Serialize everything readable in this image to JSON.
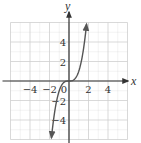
{
  "chart_data": {
    "type": "line",
    "title": "",
    "function": "y = x^3",
    "xlabel": "x",
    "ylabel": "y",
    "xlim": [
      -6,
      6
    ],
    "ylim": [
      -6,
      6
    ],
    "grid": true,
    "grid_step": 1,
    "x_ticks": [
      -4,
      -2,
      0,
      2,
      4
    ],
    "y_ticks": [
      4,
      2,
      -2,
      -4
    ],
    "tick_labels": {
      "x": [
        "−4",
        "−2",
        "0",
        "2",
        "4"
      ],
      "y": [
        "4",
        "2",
        "−2",
        "−4"
      ]
    },
    "series": [
      {
        "name": "y = x^3",
        "x": [
          -1.8,
          -1.5,
          -1.2,
          -1.0,
          -0.8,
          -0.5,
          0,
          0.5,
          0.8,
          1.0,
          1.2,
          1.5,
          1.8
        ],
        "y": [
          -5.83,
          -3.38,
          -1.73,
          -1.0,
          -0.51,
          -0.13,
          0,
          0.13,
          0.51,
          1.0,
          1.73,
          3.38,
          5.83
        ],
        "arrows_both_ends": true
      }
    ],
    "legend": null,
    "colors": {
      "axis": "#333333",
      "curve": "#555555",
      "grid": "#cfcfcf"
    }
  }
}
